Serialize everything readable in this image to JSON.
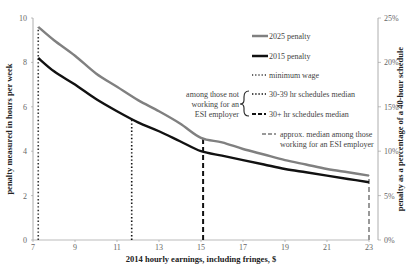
{
  "chart_data": {
    "type": "line",
    "title": "",
    "xlabel": "2014 hourly earnings, including fringes, $",
    "ylabel": "penalty measured in hours per week",
    "y2label": "penalty as a percentage of a 40-hour schedule",
    "xlim": [
      7,
      23
    ],
    "ylim": [
      0,
      10
    ],
    "y2lim": [
      0,
      25
    ],
    "x_ticks": [
      7,
      9,
      11,
      13,
      15,
      17,
      19,
      21,
      23
    ],
    "y_ticks": [
      0,
      2,
      4,
      6,
      8,
      10
    ],
    "y2_ticks": [
      "0%",
      "5%",
      "10%",
      "15%",
      "20%",
      "25%"
    ],
    "grid": false,
    "x": [
      7.25,
      8,
      9,
      10,
      11,
      12,
      13,
      14,
      15,
      16,
      17,
      18,
      19,
      20,
      21,
      22,
      23
    ],
    "series": [
      {
        "name": "2025 penalty",
        "color": "#808080",
        "values": [
          9.6,
          9.0,
          8.3,
          7.5,
          6.9,
          6.3,
          5.8,
          5.25,
          4.6,
          4.4,
          4.1,
          3.85,
          3.6,
          3.4,
          3.2,
          3.05,
          2.9
        ]
      },
      {
        "name": "2015 penalty",
        "color": "#111111",
        "values": [
          8.2,
          7.6,
          7.0,
          6.35,
          5.8,
          5.3,
          4.9,
          4.45,
          4.0,
          3.8,
          3.6,
          3.4,
          3.2,
          3.05,
          2.9,
          2.75,
          2.6
        ]
      }
    ],
    "vertical_lines": [
      {
        "name": "minimum wage",
        "x": 7.25,
        "style": "dotted",
        "color": "#333333"
      },
      {
        "name": "30-39 hr schedules median",
        "x": 11.7,
        "style": "dotted",
        "color": "#111111"
      },
      {
        "name": "30+ hr schedules median",
        "x": 15.1,
        "style": "dashed",
        "color": "#111111"
      },
      {
        "name": "approx. median among those working for an ESI employer",
        "x": 23,
        "style": "dashed",
        "color": "#999999"
      }
    ],
    "legend": {
      "position": "upper right inside",
      "entries": [
        "2025 penalty",
        "2015 penalty",
        "minimum wage",
        "30-39 hr schedules median",
        "30+ hr schedules median",
        "approx. median among those working for an ESI employer"
      ],
      "group_label": [
        "among those not",
        "working for an",
        "ESI employer"
      ]
    }
  },
  "labels": {
    "xlabel": "2014 hourly earnings, including fringes, $",
    "ylabel": "penalty measured in hours per week",
    "y2label": "penalty as a percentage of a 40-hour schedule",
    "legend_2025": "2025 penalty",
    "legend_2015": "2015 penalty",
    "legend_minwage": "minimum wage",
    "legend_3039": "30-39 hr schedules median",
    "legend_30plus": "30+ hr schedules median",
    "legend_esi_1": "approx. median among those",
    "legend_esi_2": "working for an ESI employer",
    "group_1": "among those not",
    "group_2": "working for an",
    "group_3": "ESI employer"
  }
}
